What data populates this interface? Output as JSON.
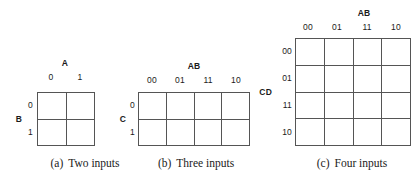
{
  "figure": {
    "title_caption_style": "lettered",
    "background_color": "#ffffff",
    "line_color": "#555555",
    "text_color": "#1a1a1a"
  },
  "maps": [
    {
      "id": "two-input",
      "caption_tag": "(a)",
      "caption_text": "Two inputs",
      "column_variable": "A",
      "row_variable": "B",
      "column_labels": [
        "0",
        "1"
      ],
      "row_labels": [
        "0",
        "1"
      ],
      "columns": 2,
      "rows": 2,
      "cells": [
        "",
        "",
        "",
        ""
      ]
    },
    {
      "id": "three-input",
      "caption_tag": "(b)",
      "caption_text": "Three inputs",
      "column_variable": "AB",
      "row_variable": "C",
      "column_labels": [
        "00",
        "01",
        "11",
        "10"
      ],
      "row_labels": [
        "0",
        "1"
      ],
      "columns": 4,
      "rows": 2,
      "cells": [
        "",
        "",
        "",
        "",
        "",
        "",
        "",
        ""
      ]
    },
    {
      "id": "four-input",
      "caption_tag": "(c)",
      "caption_text": "Four inputs",
      "column_variable": "AB",
      "row_variable": "CD",
      "column_labels": [
        "00",
        "01",
        "11",
        "10"
      ],
      "row_labels": [
        "00",
        "01",
        "11",
        "10"
      ],
      "columns": 4,
      "rows": 4,
      "cells": [
        "",
        "",
        "",
        "",
        "",
        "",
        "",
        "",
        "",
        "",
        "",
        "",
        "",
        "",
        "",
        ""
      ]
    }
  ]
}
